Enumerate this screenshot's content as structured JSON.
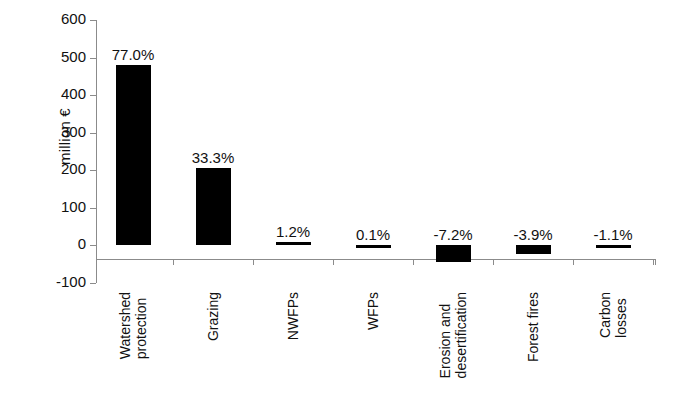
{
  "chart_data": {
    "type": "bar",
    "title": "",
    "xlabel": "",
    "ylabel": "million €",
    "ylim": [
      -100,
      600
    ],
    "yticks": [
      600,
      500,
      400,
      300,
      200,
      100,
      0,
      -100
    ],
    "ytick_labels": [
      "600",
      "500",
      "400",
      "300",
      "200",
      "100",
      "0",
      "-100"
    ],
    "grid": false,
    "legend": null,
    "bar_color": "#000000",
    "axis_color": "#8b8b8b",
    "categories": [
      "Watershed protection",
      "Grazing",
      "NWFPs",
      "WFPs",
      "Erosion and desertification",
      "Forest fires",
      "Carbon losses"
    ],
    "category_lines": [
      [
        "Watershed",
        "protection"
      ],
      [
        "Grazing"
      ],
      [
        "NWFPs"
      ],
      [
        "WFPs"
      ],
      [
        "Erosion and",
        "desertification"
      ],
      [
        "Forest fires"
      ],
      [
        "Carbon",
        "losses"
      ]
    ],
    "values": [
      480,
      205,
      8,
      1,
      -43,
      -24,
      -7
    ],
    "data_labels": [
      "77.0%",
      "33.3%",
      "1.2%",
      "0.1%",
      "-7.2%",
      "-3.9%",
      "-1.1%"
    ]
  }
}
